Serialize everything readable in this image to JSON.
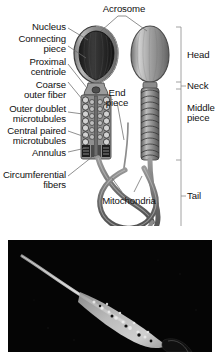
{
  "figure": {
    "panels": [
      {
        "name": "diagram",
        "type": "labeled-illustration"
      },
      {
        "name": "micrograph",
        "type": "electron-micrograph",
        "background_color": "#050505"
      }
    ]
  },
  "colors": {
    "page_background": "#ffffff",
    "text": "#111111",
    "leader_line": "#6b6b6b",
    "bracket_line": "#8a8a8a",
    "nucleus_dark": "#2a2a2a",
    "acrosome_gray": "#9a9a9a",
    "tail_gray": "#7d7d7d",
    "micrograph_background": "#050505",
    "micrograph_specimen": "#d8d8d8"
  },
  "left_labels": [
    {
      "id": "nucleus",
      "text": "Nucleus"
    },
    {
      "id": "connecting-piece",
      "text": "Connecting\npiece"
    },
    {
      "id": "proximal-centriole",
      "text": "Proximal\ncentriole"
    },
    {
      "id": "coarse-outer-fiber",
      "text": "Coarse\nouter fiber"
    },
    {
      "id": "outer-doublet-microtubules",
      "text": "Outer doublet\nmicrotubules"
    },
    {
      "id": "central-paired-microtubules",
      "text": "Central paired\nmicrotubules"
    },
    {
      "id": "annulus",
      "text": "Annulus"
    },
    {
      "id": "circumferential-fibers",
      "text": "Circumferential\nfibers"
    }
  ],
  "center_labels": [
    {
      "id": "acrosome",
      "text": "Acrosome"
    },
    {
      "id": "end-piece",
      "text": "End\npiece"
    },
    {
      "id": "mitochondria",
      "text": "Mitochondria"
    }
  ],
  "right_labels": [
    {
      "id": "head",
      "text": "Head"
    },
    {
      "id": "neck",
      "text": "Neck"
    },
    {
      "id": "middle-piece",
      "text": "Middle\npiece"
    },
    {
      "id": "tail",
      "text": "Tail"
    }
  ]
}
